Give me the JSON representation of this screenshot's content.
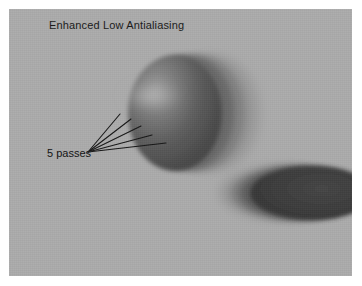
{
  "figure": {
    "title": "Enhanced Low Antialiasing",
    "canvas": {
      "background_color": "#ababab",
      "border_color": "#ffffff",
      "x": 9,
      "y": 9,
      "width": 343,
      "height": 267
    }
  },
  "annotation": {
    "label": "5 passes",
    "pass_count": 5,
    "anchor_x": 88,
    "anchor_y": 152,
    "leader_lines": [
      {
        "x1": 88,
        "y1": 152,
        "x2": 120,
        "y2": 114
      },
      {
        "x1": 88,
        "y1": 152,
        "x2": 131,
        "y2": 119
      },
      {
        "x1": 88,
        "y1": 152,
        "x2": 141,
        "y2": 126
      },
      {
        "x1": 88,
        "y1": 152,
        "x2": 152,
        "y2": 135
      },
      {
        "x1": 88,
        "y1": 152,
        "x2": 166,
        "y2": 143
      }
    ],
    "line_color": "#161616"
  },
  "objects": [
    {
      "name": "sphere",
      "shape": "sphere",
      "center_x": 175,
      "center_y": 113,
      "radius_x": 47,
      "radius_y": 58,
      "core_color": "#4a4a4a",
      "highlight_color": "#b8b8b8",
      "highlight_x": 152,
      "highlight_y": 96,
      "motion_direction": "right",
      "passes": [
        {
          "index": 1,
          "offset_x": 0,
          "color": "#4a4a4a",
          "opacity": 1.0
        },
        {
          "index": 2,
          "offset_x": 12,
          "color": "#575757",
          "opacity": 0.7
        },
        {
          "index": 3,
          "offset_x": 23,
          "color": "#6a6a6a",
          "opacity": 0.52
        },
        {
          "index": 4,
          "offset_x": 33,
          "color": "#7e7e7e",
          "opacity": 0.38
        },
        {
          "index": 5,
          "offset_x": 42,
          "color": "#909090",
          "opacity": 0.24
        }
      ]
    },
    {
      "name": "ellipse",
      "shape": "ellipse",
      "center_x": 312,
      "center_y": 193,
      "radius_x": 62,
      "radius_y": 27,
      "core_color": "#3a3a3a",
      "motion_direction": "right",
      "clipped_by": "canvas-right-edge",
      "passes": [
        {
          "index": 1,
          "offset_x": 0,
          "color": "#3a3a3a",
          "opacity": 1.0
        },
        {
          "index": 2,
          "offset_x": -10,
          "color": "#4d4d4d",
          "opacity": 0.72
        },
        {
          "index": 3,
          "offset_x": -19,
          "color": "#636363",
          "opacity": 0.54
        },
        {
          "index": 4,
          "offset_x": -27,
          "color": "#797979",
          "opacity": 0.38
        },
        {
          "index": 5,
          "offset_x": -34,
          "color": "#8e8e8e",
          "opacity": 0.24
        }
      ]
    }
  ]
}
